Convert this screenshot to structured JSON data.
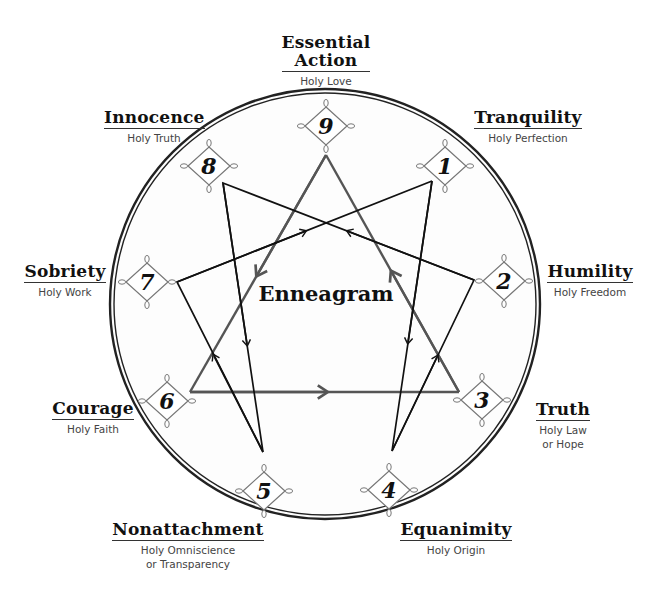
{
  "title": "Enneagram",
  "colors": {
    "triangle_line": "#555555",
    "hexad_line": "#111111",
    "circle": "#222222",
    "diamond": "#777777",
    "background": "#ffffff"
  },
  "points": [
    {
      "number": "9",
      "virtue": "Essential Action",
      "virtue_lines": [
        "Essential",
        "Action"
      ],
      "holy_idea": "Holy Love",
      "holy_idea_lines": [
        "Holy Love"
      ]
    },
    {
      "number": "1",
      "virtue": "Tranquility",
      "virtue_lines": [
        "Tranquility"
      ],
      "holy_idea": "Holy Perfection",
      "holy_idea_lines": [
        "Holy Perfection"
      ]
    },
    {
      "number": "2",
      "virtue": "Humility",
      "virtue_lines": [
        "Humility"
      ],
      "holy_idea": "Holy Freedom",
      "holy_idea_lines": [
        "Holy Freedom"
      ]
    },
    {
      "number": "3",
      "virtue": "Truth",
      "virtue_lines": [
        "Truth"
      ],
      "holy_idea": "Holy Law or Hope",
      "holy_idea_lines": [
        "Holy Law",
        "or Hope"
      ]
    },
    {
      "number": "4",
      "virtue": "Equanimity",
      "virtue_lines": [
        "Equanimity"
      ],
      "holy_idea": "Holy Origin",
      "holy_idea_lines": [
        "Holy Origin"
      ]
    },
    {
      "number": "5",
      "virtue": "Nonattachment",
      "virtue_lines": [
        "Nonattachment"
      ],
      "holy_idea": "Holy Omniscience or Transparency",
      "holy_idea_lines": [
        "Holy Omniscience",
        "or Transparency"
      ]
    },
    {
      "number": "6",
      "virtue": "Courage",
      "virtue_lines": [
        "Courage"
      ],
      "holy_idea": "Holy Faith",
      "holy_idea_lines": [
        "Holy Faith"
      ]
    },
    {
      "number": "7",
      "virtue": "Sobriety",
      "virtue_lines": [
        "Sobriety"
      ],
      "holy_idea": "Holy Work",
      "holy_idea_lines": [
        "Holy Work"
      ]
    },
    {
      "number": "8",
      "virtue": "Innocence",
      "virtue_lines": [
        "Innocence"
      ],
      "holy_idea": "Holy Truth",
      "holy_idea_lines": [
        "Holy Truth"
      ]
    }
  ],
  "connections": {
    "triangle": [
      "9",
      "6",
      "3",
      "9"
    ],
    "hexad": [
      "1",
      "4",
      "2",
      "8",
      "5",
      "7",
      "1"
    ]
  }
}
